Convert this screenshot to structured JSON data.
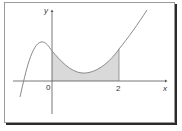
{
  "figure": {
    "axes": {
      "x_label": "x",
      "y_label": "y",
      "origin_label": "0",
      "tick_label": "2"
    },
    "shaded_region": {
      "from": "0",
      "to": "2",
      "fill": "#d9d9d9"
    },
    "colors": {
      "curve": "#8a8a8a",
      "axes": "#555555",
      "frame_shadow": "#2a2a2a"
    }
  }
}
